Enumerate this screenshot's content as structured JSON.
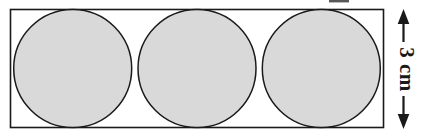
{
  "figure": {
    "background_color": "#ffffff",
    "stroke_color": "#1a1a1a",
    "circle_fill_color": "#d9d9d9"
  },
  "rectangle": {
    "x": 10.5,
    "y": 9.5,
    "width": 373,
    "height": 118,
    "stroke_width": 1.6
  },
  "circles": [
    {
      "cx": 72.7,
      "cy": 68.5,
      "r": 59
    },
    {
      "cx": 197.0,
      "cy": 68.5,
      "r": 59
    },
    {
      "cx": 321.3,
      "cy": 68.5,
      "r": 59
    }
  ],
  "dimension": {
    "label": "3 cm",
    "orientation": "vertical",
    "rotation_degrees": 90,
    "line_x": 403.5,
    "arrow_top_y": 10,
    "arrow_bottom_y": 128,
    "arrow_head_width": 11,
    "arrow_head_length": 14
  },
  "artifact": {
    "description": "cropped-glyph-edge",
    "x": 329,
    "y": 0,
    "width": 20,
    "height": 3,
    "color": "#3a3a3a"
  }
}
